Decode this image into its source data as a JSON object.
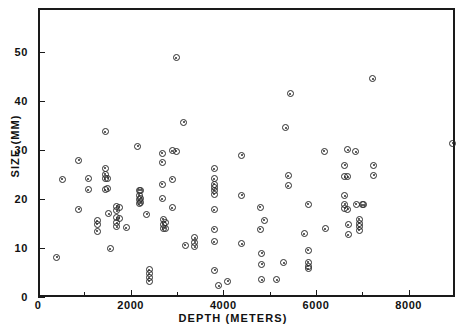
{
  "chart_data": {
    "type": "scatter",
    "title": "",
    "xlabel": "DEPTH (METERS)",
    "ylabel": "SIZE (MM)",
    "xlim": [
      0,
      9000
    ],
    "ylim": [
      0,
      59
    ],
    "grid": false,
    "legend": null,
    "marker": "circle-with-center-dot",
    "x_ticks_major": [
      0,
      2000,
      4000,
      6000,
      8000
    ],
    "x_ticks_minor": [
      1000,
      3000,
      5000,
      7000
    ],
    "x_tick_labels": [
      "0",
      "2000",
      "4000",
      "6000",
      "8000"
    ],
    "y_ticks_major": [
      0,
      10,
      20,
      30,
      40,
      50
    ],
    "y_tick_labels": [
      "0",
      "10",
      "20",
      "30",
      "40",
      "50"
    ],
    "points": [
      [
        400,
        8.1
      ],
      [
        520,
        24.0
      ],
      [
        880,
        27.9
      ],
      [
        880,
        17.9
      ],
      [
        1080,
        24.1
      ],
      [
        1080,
        21.9
      ],
      [
        1280,
        15.6
      ],
      [
        1280,
        14.9
      ],
      [
        1280,
        13.4
      ],
      [
        1450,
        33.7
      ],
      [
        1450,
        26.3
      ],
      [
        1450,
        25.1
      ],
      [
        1450,
        24.1
      ],
      [
        1450,
        21.9
      ],
      [
        1500,
        24.2
      ],
      [
        1500,
        22.1
      ],
      [
        1530,
        17.0
      ],
      [
        1560,
        9.8
      ],
      [
        1700,
        18.5
      ],
      [
        1700,
        17.6
      ],
      [
        1700,
        16.2
      ],
      [
        1700,
        15.2
      ],
      [
        1700,
        14.3
      ],
      [
        1750,
        18.3
      ],
      [
        1750,
        16.1
      ],
      [
        1900,
        14.1
      ],
      [
        2150,
        30.8
      ],
      [
        2180,
        21.8
      ],
      [
        2180,
        20.8
      ],
      [
        2180,
        19.9
      ],
      [
        2180,
        19.0
      ],
      [
        2220,
        21.8
      ],
      [
        2220,
        20.2
      ],
      [
        2220,
        19.2
      ],
      [
        2350,
        16.9
      ],
      [
        2400,
        5.6
      ],
      [
        2400,
        4.7
      ],
      [
        2400,
        3.9
      ],
      [
        2400,
        3.2
      ],
      [
        2680,
        29.3
      ],
      [
        2680,
        27.5
      ],
      [
        2680,
        23.0
      ],
      [
        2680,
        20.1
      ],
      [
        2700,
        15.9
      ],
      [
        2700,
        14.9
      ],
      [
        2700,
        13.9
      ],
      [
        2750,
        15.3
      ],
      [
        2750,
        14.0
      ],
      [
        2900,
        29.9
      ],
      [
        2900,
        24.0
      ],
      [
        2900,
        18.2
      ],
      [
        2980,
        48.8
      ],
      [
        2980,
        29.8
      ],
      [
        3150,
        35.7
      ],
      [
        3180,
        10.6
      ],
      [
        3380,
        12.1
      ],
      [
        3380,
        11.2
      ],
      [
        3380,
        10.3
      ],
      [
        3800,
        26.2
      ],
      [
        3800,
        24.1
      ],
      [
        3800,
        23.0
      ],
      [
        3800,
        21.8
      ],
      [
        3800,
        21.0
      ],
      [
        3800,
        17.8
      ],
      [
        3800,
        13.8
      ],
      [
        3800,
        11.3
      ],
      [
        3820,
        22.3
      ],
      [
        3820,
        5.5
      ],
      [
        3900,
        2.3
      ],
      [
        4100,
        3.2
      ],
      [
        4400,
        28.9
      ],
      [
        4400,
        20.8
      ],
      [
        4400,
        10.9
      ],
      [
        4800,
        18.3
      ],
      [
        4800,
        13.8
      ],
      [
        4830,
        8.9
      ],
      [
        4830,
        6.7
      ],
      [
        4830,
        3.5
      ],
      [
        4880,
        15.7
      ],
      [
        5150,
        3.5
      ],
      [
        5300,
        7.0
      ],
      [
        5350,
        34.6
      ],
      [
        5400,
        24.8
      ],
      [
        5400,
        22.7
      ],
      [
        5440,
        41.5
      ],
      [
        5750,
        12.9
      ],
      [
        5830,
        18.9
      ],
      [
        5830,
        9.5
      ],
      [
        5830,
        7.1
      ],
      [
        5830,
        6.3
      ],
      [
        5830,
        5.8
      ],
      [
        6180,
        29.8
      ],
      [
        6200,
        13.9
      ],
      [
        6620,
        26.9
      ],
      [
        6620,
        24.6
      ],
      [
        6620,
        20.7
      ],
      [
        6620,
        18.9
      ],
      [
        6620,
        18.1
      ],
      [
        6680,
        30.1
      ],
      [
        6680,
        24.6
      ],
      [
        6680,
        17.9
      ],
      [
        6700,
        14.7
      ],
      [
        6700,
        12.7
      ],
      [
        6860,
        29.7
      ],
      [
        6870,
        18.9
      ],
      [
        6930,
        15.9
      ],
      [
        6930,
        15.1
      ],
      [
        6930,
        14.3
      ],
      [
        6930,
        13.6
      ],
      [
        7000,
        18.8
      ],
      [
        7030,
        18.8
      ],
      [
        7230,
        44.6
      ],
      [
        7250,
        26.9
      ],
      [
        7250,
        24.9
      ],
      [
        8950,
        31.4
      ]
    ]
  },
  "axes": {
    "x_title": "DEPTH (METERS)",
    "y_title": "SIZE (MM)"
  }
}
